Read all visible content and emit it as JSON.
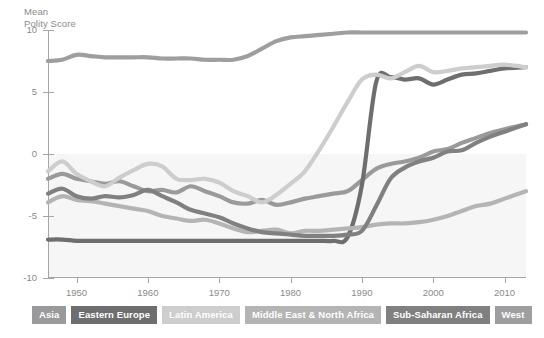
{
  "chart_data": {
    "type": "line",
    "title": "Mean\nPolity Score",
    "ylabel": "Mean Polity Score",
    "xlabel": "",
    "ylim": [
      -10,
      10
    ],
    "xlim": [
      1946,
      2013
    ],
    "yticks": [
      10,
      5,
      0,
      -5,
      -10
    ],
    "ytick_labels": [
      "10",
      "5",
      "0",
      "-5",
      "-10"
    ],
    "xticks": [
      1950,
      1960,
      1970,
      1980,
      1990,
      2000,
      2010
    ],
    "xtick_labels": [
      "1950",
      "1960",
      "1970",
      "1980",
      "1990",
      "2000",
      "2010"
    ],
    "grid": false,
    "legend_position": "bottom",
    "x": [
      1946,
      1948,
      1950,
      1952,
      1954,
      1956,
      1958,
      1960,
      1962,
      1964,
      1966,
      1968,
      1970,
      1972,
      1974,
      1976,
      1978,
      1980,
      1982,
      1984,
      1986,
      1988,
      1990,
      1992,
      1994,
      1996,
      1998,
      2000,
      2002,
      2004,
      2006,
      2008,
      2010,
      2013
    ],
    "series": [
      {
        "name": "Asia",
        "color": "#9a9a9a",
        "values": [
          -2.0,
          -1.6,
          -2.0,
          -2.2,
          -2.4,
          -2.2,
          -2.6,
          -3.0,
          -2.9,
          -3.1,
          -2.6,
          -3.0,
          -3.4,
          -3.9,
          -4.0,
          -3.7,
          -4.1,
          -3.9,
          -3.6,
          -3.4,
          -3.2,
          -3.0,
          -2.1,
          -1.2,
          -0.8,
          -0.6,
          -0.3,
          0.2,
          0.4,
          0.9,
          1.3,
          1.7,
          2.0,
          2.4
        ]
      },
      {
        "name": "Eastern Europe",
        "color": "#6e6e6e",
        "values": [
          -6.9,
          -6.9,
          -7.0,
          -7.0,
          -7.0,
          -7.0,
          -7.0,
          -7.0,
          -7.0,
          -7.0,
          -7.0,
          -7.0,
          -7.0,
          -7.0,
          -7.0,
          -7.0,
          -7.0,
          -7.0,
          -7.0,
          -7.0,
          -7.0,
          -6.7,
          -2.5,
          5.8,
          6.2,
          6.0,
          6.1,
          5.6,
          6.0,
          6.4,
          6.5,
          6.7,
          6.9,
          7.0
        ]
      },
      {
        "name": "Latin America",
        "color": "#cdcdcd",
        "values": [
          -1.4,
          -0.6,
          -1.6,
          -2.2,
          -2.6,
          -1.9,
          -1.3,
          -0.8,
          -1.0,
          -2.0,
          -2.1,
          -2.0,
          -2.3,
          -3.0,
          -3.4,
          -3.9,
          -3.3,
          -2.4,
          -1.4,
          0.3,
          2.2,
          4.2,
          6.0,
          6.4,
          6.1,
          6.6,
          7.1,
          6.6,
          6.7,
          6.9,
          7.0,
          7.1,
          7.2,
          7.0
        ]
      },
      {
        "name": "Middle East & North Africa",
        "color": "#b4b4b4",
        "values": [
          -3.9,
          -3.4,
          -3.7,
          -3.8,
          -4.0,
          -4.2,
          -4.4,
          -4.6,
          -5.0,
          -5.2,
          -5.4,
          -5.3,
          -5.6,
          -6.0,
          -6.3,
          -6.2,
          -6.1,
          -6.4,
          -6.2,
          -6.2,
          -6.1,
          -6.0,
          -5.9,
          -5.7,
          -5.6,
          -5.6,
          -5.5,
          -5.3,
          -5.0,
          -4.6,
          -4.2,
          -4.0,
          -3.6,
          -3.0
        ]
      },
      {
        "name": "Sub-Saharan Africa",
        "color": "#808080",
        "values": [
          -3.2,
          -2.8,
          -3.4,
          -3.6,
          -3.4,
          -3.5,
          -3.3,
          -2.9,
          -3.4,
          -3.9,
          -4.5,
          -4.8,
          -5.1,
          -5.6,
          -6.0,
          -6.3,
          -6.4,
          -6.5,
          -6.6,
          -6.6,
          -6.6,
          -6.5,
          -6.2,
          -4.2,
          -2.0,
          -1.1,
          -0.6,
          -0.3,
          0.2,
          0.3,
          0.9,
          1.4,
          1.8,
          2.4
        ]
      },
      {
        "name": "West",
        "color": "#9e9e9e",
        "values": [
          7.5,
          7.6,
          8.0,
          7.9,
          7.8,
          7.8,
          7.8,
          7.8,
          7.7,
          7.7,
          7.7,
          7.6,
          7.6,
          7.6,
          7.9,
          8.5,
          9.1,
          9.4,
          9.5,
          9.6,
          9.7,
          9.8,
          9.8,
          9.8,
          9.8,
          9.8,
          9.8,
          9.8,
          9.8,
          9.8,
          9.8,
          9.8,
          9.8,
          9.8
        ]
      }
    ]
  },
  "legend": {
    "items": [
      {
        "label": "Asia",
        "color": "#9a9a9a"
      },
      {
        "label": "Eastern Europe",
        "color": "#6e6e6e"
      },
      {
        "label": "Latin America",
        "color": "#cdcdcd"
      },
      {
        "label": "Middle East & North Africa",
        "color": "#b4b4b4"
      },
      {
        "label": "Sub-Saharan Africa",
        "color": "#808080"
      },
      {
        "label": "West",
        "color": "#9e9e9e"
      }
    ]
  }
}
